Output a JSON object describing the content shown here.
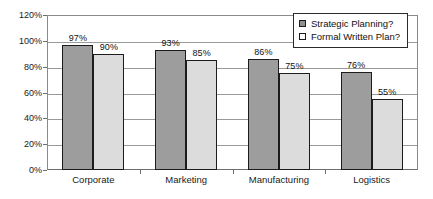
{
  "chart_data": {
    "type": "bar",
    "title": "",
    "xlabel": "",
    "ylabel": "",
    "categories": [
      "Corporate",
      "Marketing",
      "Manufacturing",
      "Logistics"
    ],
    "series": [
      {
        "name": "Strategic Planning?",
        "values": [
          97,
          93,
          86,
          76
        ],
        "color": "#9d9d9d"
      },
      {
        "name": "Formal Written Plan?",
        "values": [
          90,
          85,
          75,
          55
        ],
        "color": "#dcdcdc"
      }
    ],
    "value_labels": [
      [
        "97%",
        "90%"
      ],
      [
        "93%",
        "85%"
      ],
      [
        "86%",
        "75%"
      ],
      [
        "76%",
        "55%"
      ]
    ],
    "ylim": [
      0,
      120
    ],
    "ytick_values": [
      0,
      20,
      40,
      60,
      80,
      100,
      120
    ],
    "ytick_labels": [
      "0%",
      "20%",
      "40%",
      "60%",
      "80%",
      "100%",
      "120%"
    ],
    "grid": true,
    "legend_position": "top-right",
    "legend": [
      "Strategic Planning?",
      "Formal Written Plan?"
    ]
  }
}
